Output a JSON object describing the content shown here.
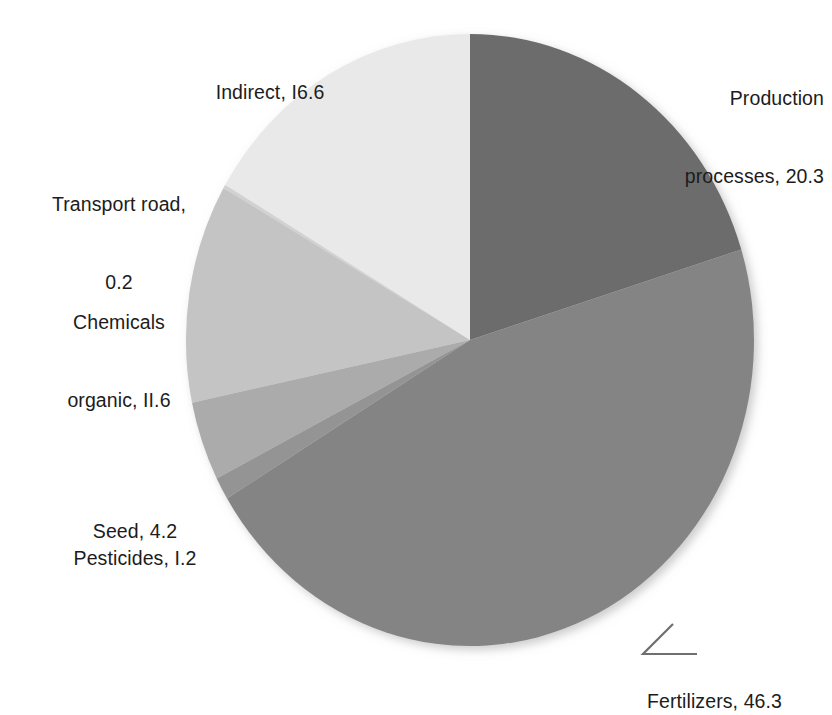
{
  "chart_data": {
    "type": "pie",
    "title": "",
    "subtitle": "",
    "xlabel": "",
    "ylabel": "",
    "legend_position": "none",
    "grid": false,
    "total": 100.4,
    "units": "percent",
    "start_angle_deg": 0,
    "direction": "clockwise",
    "categories": [
      "Production processes",
      "Fertilizers",
      "Pesticides",
      "Seed",
      "Chemicals organic",
      "Transport road",
      "Indirect"
    ],
    "values": [
      20.3,
      46.3,
      1.2,
      4.2,
      11.6,
      0.2,
      16.6
    ],
    "colors": [
      "#6c6c6c",
      "#848484",
      "#949494",
      "#ababab",
      "#c4c4c4",
      "#d2d2d2",
      "#e9e9e9"
    ],
    "slices": [
      {
        "name": "Production processes",
        "value": 20.3,
        "label": "Production\nprocesses, 20.3",
        "color": "#6c6c6c"
      },
      {
        "name": "Fertilizers",
        "value": 46.3,
        "label": "Fertilizers, 46.3",
        "color": "#848484"
      },
      {
        "name": "Pesticides",
        "value": 1.2,
        "label": "Pesticides, I.2",
        "color": "#949494"
      },
      {
        "name": "Seed",
        "value": 4.2,
        "label": "Seed, 4.2",
        "color": "#ababab"
      },
      {
        "name": "Chemicals organic",
        "value": 11.6,
        "label": "Chemicals\norganic, II.6",
        "color": "#c4c4c4"
      },
      {
        "name": "Transport road",
        "value": 0.2,
        "label": "Transport road,\n0.2",
        "color": "#d2d2d2"
      },
      {
        "name": "Indirect",
        "value": 16.6,
        "label": "Indirect, I6.6",
        "color": "#e9e9e9"
      }
    ]
  },
  "labels": {
    "indirect": "Indirect, I6.6",
    "transport_line1": "Transport road,",
    "transport_line2": "0.2",
    "chemicals_line1": "Chemicals",
    "chemicals_line2": "organic, II.6",
    "seed": "Seed, 4.2",
    "pesticides": "Pesticides, I.2",
    "fertilizers": "Fertilizers, 46.3",
    "production_line1": "Production",
    "production_line2": "processes, 20.3"
  }
}
